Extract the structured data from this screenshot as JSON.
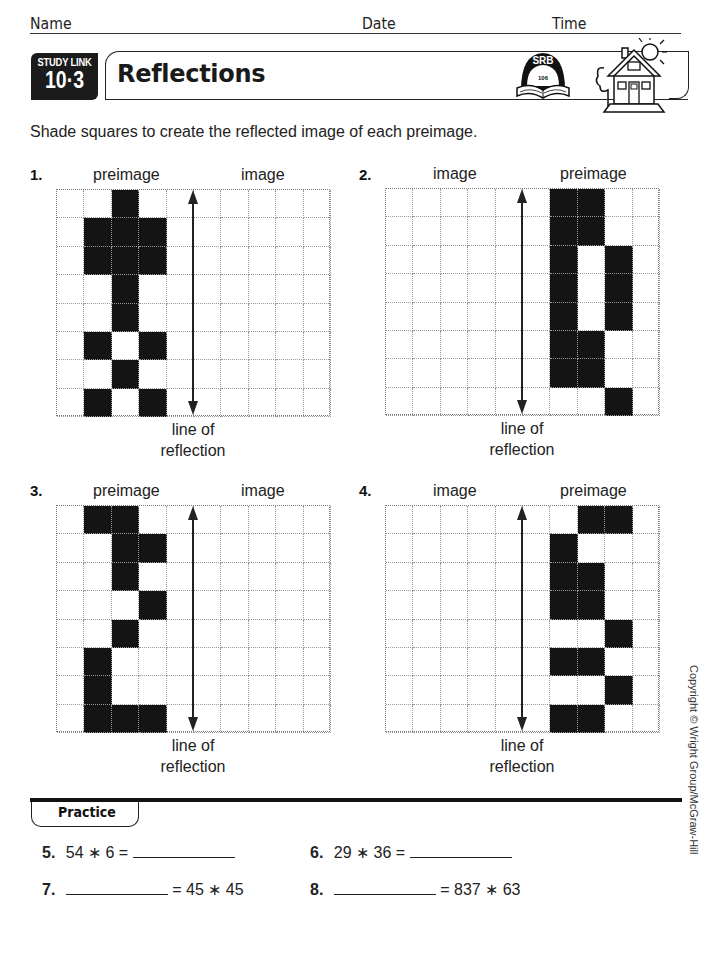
{
  "header": {
    "name_label": "Name",
    "date_label": "Date",
    "time_label": "Time"
  },
  "banner": {
    "study_link_label": "STUDY LINK",
    "study_link_number": "10·3",
    "title": "Reflections",
    "srb_label": "SRB",
    "srb_page": "106",
    "icons": [
      "srb-book-icon",
      "home-link-house-icon"
    ]
  },
  "instruction": "Shade squares to create the reflected image of each preimage.",
  "grid_common": {
    "rows": 8,
    "cols": 10,
    "reflection_line_after_col": 5,
    "line_label_1": "line of",
    "line_label_2": "reflection"
  },
  "problems": [
    {
      "number": "1.",
      "left_label": "preimage",
      "right_label": "image",
      "shaded": [
        [
          0,
          2
        ],
        [
          1,
          1
        ],
        [
          1,
          2
        ],
        [
          1,
          3
        ],
        [
          2,
          1
        ],
        [
          2,
          2
        ],
        [
          2,
          3
        ],
        [
          3,
          2
        ],
        [
          4,
          2
        ],
        [
          5,
          1
        ],
        [
          5,
          3
        ],
        [
          6,
          2
        ],
        [
          7,
          1
        ],
        [
          7,
          3
        ]
      ]
    },
    {
      "number": "2.",
      "left_label": "image",
      "right_label": "preimage",
      "shaded": [
        [
          0,
          6
        ],
        [
          0,
          7
        ],
        [
          1,
          6
        ],
        [
          1,
          7
        ],
        [
          2,
          6
        ],
        [
          2,
          8
        ],
        [
          3,
          6
        ],
        [
          3,
          8
        ],
        [
          4,
          6
        ],
        [
          4,
          8
        ],
        [
          5,
          6
        ],
        [
          5,
          7
        ],
        [
          6,
          6
        ],
        [
          6,
          7
        ],
        [
          7,
          8
        ]
      ]
    },
    {
      "number": "3.",
      "left_label": "preimage",
      "right_label": "image",
      "shaded": [
        [
          0,
          1
        ],
        [
          0,
          2
        ],
        [
          1,
          2
        ],
        [
          1,
          3
        ],
        [
          2,
          2
        ],
        [
          3,
          3
        ],
        [
          4,
          2
        ],
        [
          5,
          1
        ],
        [
          6,
          1
        ],
        [
          7,
          1
        ],
        [
          7,
          2
        ],
        [
          7,
          3
        ]
      ]
    },
    {
      "number": "4.",
      "left_label": "image",
      "right_label": "preimage",
      "shaded": [
        [
          0,
          7
        ],
        [
          0,
          8
        ],
        [
          1,
          6
        ],
        [
          2,
          6
        ],
        [
          2,
          7
        ],
        [
          3,
          6
        ],
        [
          3,
          7
        ],
        [
          4,
          8
        ],
        [
          5,
          6
        ],
        [
          5,
          7
        ],
        [
          6,
          8
        ],
        [
          7,
          6
        ],
        [
          7,
          7
        ]
      ]
    }
  ],
  "practice": {
    "heading": "Practice",
    "items": [
      {
        "number": "5.",
        "before": "54 ∗ 6 =",
        "after": ""
      },
      {
        "number": "6.",
        "before": "29 ∗ 36 =",
        "after": ""
      },
      {
        "number": "7.",
        "before": "",
        "after": "= 45 ∗ 45"
      },
      {
        "number": "8.",
        "before": "",
        "after": "= 837 ∗ 63"
      }
    ]
  },
  "copyright": "Copyright © Wright Group/McGraw-Hill"
}
